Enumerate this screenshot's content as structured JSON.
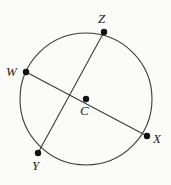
{
  "figure": {
    "kind": "circle-geometry-diagram",
    "background_color": "#fbfbfa",
    "stroke_color": "#3a3a3a",
    "point_color": "#111111",
    "label_color": "#1a1a1a",
    "circle": {
      "center_label": "C",
      "cx": 86,
      "cy": 99,
      "r": 66
    },
    "points": [
      {
        "label": "Z",
        "x": 104,
        "y": 32,
        "label_x": 98,
        "label_y": 12
      },
      {
        "label": "W",
        "x": 26,
        "y": 72,
        "label_x": 6,
        "label_y": 65
      },
      {
        "label": "C",
        "x": 86,
        "y": 99,
        "label_x": 80,
        "label_y": 104
      },
      {
        "label": "X",
        "x": 147,
        "y": 136,
        "label_x": 153,
        "label_y": 132
      },
      {
        "label": "Y",
        "x": 38,
        "y": 153,
        "label_x": 32,
        "label_y": 159
      }
    ],
    "segments": [
      {
        "name": "diameter-WX",
        "from": "W",
        "to": "X",
        "x1": 26,
        "y1": 72,
        "x2": 147,
        "y2": 136
      },
      {
        "name": "chord-ZY",
        "from": "Z",
        "to": "Y",
        "x1": 104,
        "y1": 32,
        "x2": 38,
        "y2": 153
      }
    ]
  }
}
